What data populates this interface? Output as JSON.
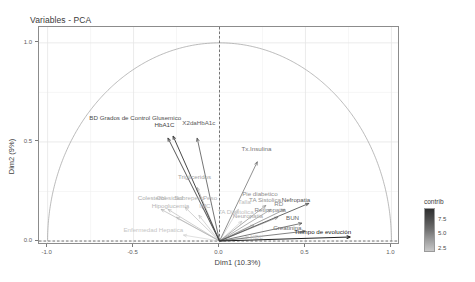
{
  "title": "Variables - PCA",
  "axes": {
    "x_title": "Dim1 (10.3%)",
    "y_title": "Dim2 (9%)",
    "x_ticks": [
      "-1.0",
      "-0.5",
      "0.0",
      "0.5",
      "1.0"
    ],
    "y_ticks": [
      "0.0",
      "0.5",
      "1.0"
    ]
  },
  "legend": {
    "title": "contrib",
    "ticks": [
      "7.5",
      "5.0",
      "2.5"
    ]
  },
  "chart_data": {
    "type": "scatter",
    "title": "Variables - PCA",
    "xlabel": "Dim1 (10.3%)",
    "ylabel": "Dim2 (9%)",
    "xlim": [
      -1.05,
      1.05
    ],
    "ylim": [
      -0.02,
      1.08
    ],
    "grid": true,
    "legend_position": "right",
    "legend_title": "contrib",
    "legend_ticks": [
      7.5,
      5.0,
      2.5
    ],
    "unit_circle": true,
    "note": "PCA correlation circle (variables factor map); arrows start at origin (0,0)",
    "points": [
      {
        "label": "BD Grados de Control Glusemico",
        "x": -0.3,
        "y": 0.52,
        "contrib": 6.0,
        "label_x": -0.49,
        "label_y": 0.62
      },
      {
        "label": "HbA1C",
        "x": -0.27,
        "y": 0.53,
        "contrib": 6.4,
        "label_x": -0.32,
        "label_y": 0.585
      },
      {
        "label": "X2daHbA1c",
        "x": -0.13,
        "y": 0.52,
        "contrib": 5.2,
        "label_x": -0.12,
        "label_y": 0.595
      },
      {
        "label": "Tx.Insulina",
        "x": 0.22,
        "y": 0.4,
        "contrib": 4.4,
        "label_x": 0.215,
        "label_y": 0.465
      },
      {
        "label": "Trigliceridos",
        "x": -0.13,
        "y": 0.27,
        "contrib": 2.6,
        "label_x": -0.145,
        "label_y": 0.325
      },
      {
        "label": "Colesterol",
        "x": -0.34,
        "y": 0.16,
        "contrib": 2.2,
        "label_x": -0.395,
        "label_y": 0.215
      },
      {
        "label": "Obesidad",
        "x": -0.3,
        "y": 0.16,
        "contrib": 2.0,
        "label_x": -0.29,
        "label_y": 0.215
      },
      {
        "label": "Sobrepeso",
        "x": -0.2,
        "y": 0.17,
        "contrib": 1.9,
        "label_x": -0.175,
        "label_y": 0.215
      },
      {
        "label": "Peso",
        "x": -0.1,
        "y": 0.18,
        "contrib": 2.1,
        "label_x": -0.055,
        "label_y": 0.215
      },
      {
        "label": "Hipoglucemia",
        "x": -0.25,
        "y": 0.12,
        "contrib": 1.8,
        "label_x": -0.285,
        "label_y": 0.175
      },
      {
        "label": "IMC",
        "x": -0.12,
        "y": 0.13,
        "contrib": 1.7,
        "label_x": -0.085,
        "label_y": 0.175
      },
      {
        "label": "Talla",
        "x": 0.11,
        "y": 0.16,
        "contrib": 1.6,
        "label_x": 0.145,
        "label_y": 0.195
      },
      {
        "label": "Pie diabetico",
        "x": 0.27,
        "y": 0.18,
        "contrib": 3.4,
        "label_x": 0.235,
        "label_y": 0.235
      },
      {
        "label": "TA Sistolica",
        "x": 0.3,
        "y": 0.16,
        "contrib": 3.2,
        "label_x": 0.265,
        "label_y": 0.205
      },
      {
        "label": "TA Diastolica",
        "x": 0.13,
        "y": 0.1,
        "contrib": 1.5,
        "label_x": 0.095,
        "label_y": 0.145
      },
      {
        "label": "RD",
        "x": 0.38,
        "y": 0.16,
        "contrib": 3.8,
        "label_x": 0.345,
        "label_y": 0.185
      },
      {
        "label": "Nefropatia",
        "x": 0.52,
        "y": 0.19,
        "contrib": 5.6,
        "label_x": 0.445,
        "label_y": 0.205
      },
      {
        "label": "Retinopatia",
        "x": 0.34,
        "y": 0.12,
        "contrib": 3.6,
        "label_x": 0.295,
        "label_y": 0.155
      },
      {
        "label": "Neuropatia",
        "x": 0.2,
        "y": 0.08,
        "contrib": 2.4,
        "label_x": 0.165,
        "label_y": 0.125
      },
      {
        "label": "BUN",
        "x": 0.48,
        "y": 0.09,
        "contrib": 5.0,
        "label_x": 0.425,
        "label_y": 0.115
      },
      {
        "label": "Creatinina",
        "x": 0.5,
        "y": 0.05,
        "contrib": 4.8,
        "label_x": 0.395,
        "label_y": 0.065
      },
      {
        "label": "Tiempo de evolución",
        "x": 0.76,
        "y": 0.02,
        "contrib": 7.6,
        "label_x": 0.6,
        "label_y": 0.045
      },
      {
        "label": "Enfermedad Hepatica",
        "x": -0.21,
        "y": 0.03,
        "contrib": 1.2,
        "label_x": -0.385,
        "label_y": 0.055
      },
      {
        "label": "HDL",
        "x": 0.17,
        "y": 0.02,
        "contrib": 1.3,
        "label_x": 0.215,
        "label_y": 0.018
      }
    ]
  }
}
